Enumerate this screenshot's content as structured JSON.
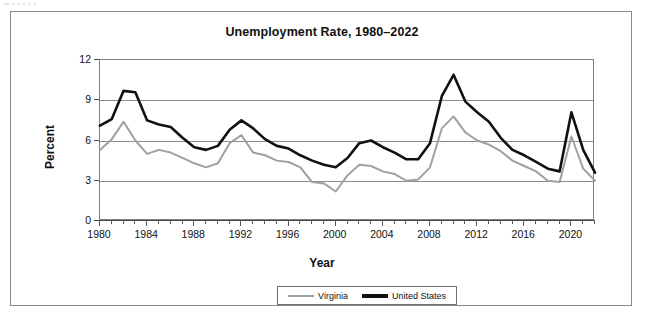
{
  "scan_artifact_text": "eg. 2. 0. 2. 2. 2.",
  "chart_frame": {
    "title": "Unemployment Rate, 1980–2022"
  },
  "axes": {
    "y_label": "Percent",
    "x_label": "Year",
    "y_ticks": [
      "0",
      "3",
      "6",
      "9",
      "12"
    ],
    "x_ticks": [
      "1980",
      "1984",
      "1988",
      "1992",
      "1996",
      "2000",
      "2004",
      "2008",
      "2012",
      "2016",
      "2020"
    ]
  },
  "legend": {
    "items": [
      {
        "label": "Virginia",
        "color": "#a0a0a0",
        "style": "thin"
      },
      {
        "label": "United States",
        "color": "#111111",
        "style": "thick"
      }
    ]
  },
  "chart_data": {
    "type": "line",
    "title": "Unemployment Rate, 1980–2022",
    "xlabel": "Year",
    "ylabel": "Percent",
    "xlim": [
      1980,
      2022
    ],
    "ylim": [
      0,
      12
    ],
    "grid": true,
    "legend_position": "bottom",
    "x": [
      1980,
      1981,
      1982,
      1983,
      1984,
      1985,
      1986,
      1987,
      1988,
      1989,
      1990,
      1991,
      1992,
      1993,
      1994,
      1995,
      1996,
      1997,
      1998,
      1999,
      2000,
      2001,
      2002,
      2003,
      2004,
      2005,
      2006,
      2007,
      2008,
      2009,
      2010,
      2011,
      2012,
      2013,
      2014,
      2015,
      2016,
      2017,
      2018,
      2019,
      2020,
      2021,
      2022
    ],
    "series": [
      {
        "name": "United States",
        "color": "#111111",
        "values": [
          7.1,
          7.6,
          9.7,
          9.6,
          7.5,
          7.2,
          7.0,
          6.2,
          5.5,
          5.3,
          5.6,
          6.8,
          7.5,
          6.9,
          6.1,
          5.6,
          5.4,
          4.9,
          4.5,
          4.2,
          4.0,
          4.7,
          5.8,
          6.0,
          5.5,
          5.1,
          4.6,
          4.6,
          5.8,
          9.3,
          10.9,
          8.9,
          8.1,
          7.4,
          6.2,
          5.3,
          4.9,
          4.4,
          3.9,
          3.7,
          8.1,
          5.3,
          3.6
        ]
      },
      {
        "name": "Virginia",
        "color": "#a0a0a0",
        "values": [
          5.3,
          6.1,
          7.4,
          6.0,
          5.0,
          5.3,
          5.1,
          4.7,
          4.3,
          4.0,
          4.3,
          5.8,
          6.4,
          5.1,
          4.9,
          4.5,
          4.4,
          4.0,
          2.9,
          2.8,
          2.2,
          3.4,
          4.2,
          4.1,
          3.7,
          3.5,
          3.0,
          3.1,
          4.0,
          6.9,
          7.8,
          6.6,
          6.0,
          5.7,
          5.2,
          4.5,
          4.1,
          3.7,
          3.0,
          2.9,
          6.3,
          3.9,
          3.0
        ]
      }
    ]
  }
}
